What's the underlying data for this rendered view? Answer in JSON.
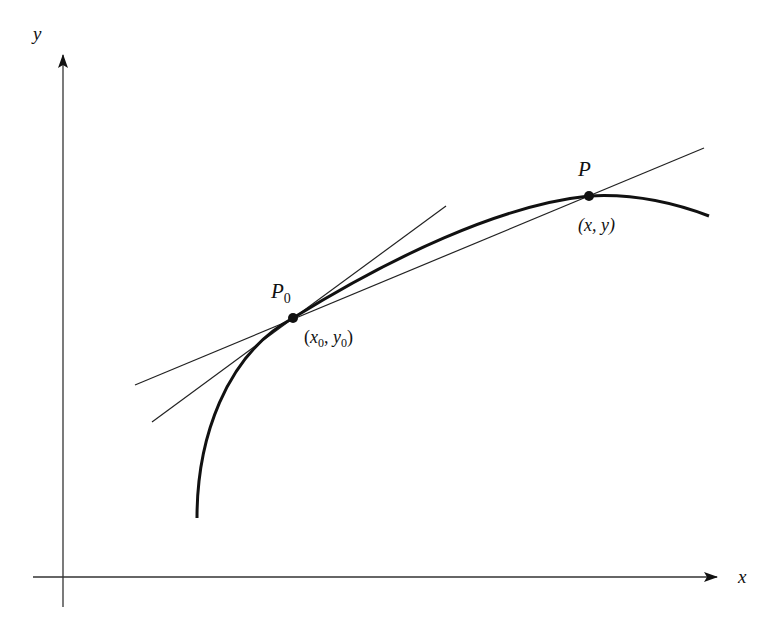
{
  "diagram": {
    "type": "geometry",
    "colors": {
      "background": "#ffffff",
      "ink": "#111111"
    },
    "axes": {
      "x": {
        "label": "x",
        "from": [
          33,
          577
        ],
        "to": [
          717,
          577
        ]
      },
      "y": {
        "label": "y",
        "from": [
          63,
          607
        ],
        "to": [
          63,
          55
        ]
      }
    },
    "points": {
      "p0": {
        "name": "P",
        "subscript": "0",
        "coord_label": {
          "open": "(",
          "x": "x",
          "x_sub": "0",
          "sep": ", ",
          "y": "y",
          "y_sub": "0",
          "close": ")"
        },
        "pos": [
          293,
          318
        ]
      },
      "p": {
        "name": "P",
        "coord_label": "(x, y)",
        "pos": [
          589,
          196
        ]
      }
    },
    "lines": {
      "tangent": {
        "label": "tangent at P0",
        "from": [
          152,
          422
        ],
        "to": [
          446,
          206
        ]
      },
      "secant": {
        "label": "secant through P0 and P",
        "from": [
          135,
          385
        ],
        "to": [
          704,
          148
        ]
      }
    },
    "curve": {
      "label": "curve",
      "start": [
        197,
        518
      ],
      "end": [
        709,
        216
      ]
    }
  }
}
